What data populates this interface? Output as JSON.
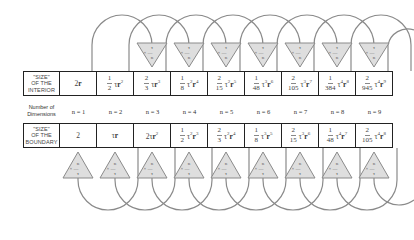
{
  "diagram": {
    "interior_row": {
      "header": "\"SIZE\" OF THE INTERIOR",
      "header_lines": [
        "\"SIZE\"",
        "OF THE",
        "INTERIOR"
      ],
      "cells": [
        {
          "coef_num": "",
          "coef_den": "",
          "expr": "2r",
          "tau_pow": "",
          "r_pow": ""
        },
        {
          "coef_num": "1",
          "coef_den": "2",
          "expr": "τr",
          "tau_pow": "",
          "r_pow": "2"
        },
        {
          "coef_num": "2",
          "coef_den": "3",
          "expr": "τr",
          "tau_pow": "",
          "r_pow": "3"
        },
        {
          "coef_num": "1",
          "coef_den": "8",
          "expr": "τr",
          "tau_pow": "2",
          "r_pow": "4"
        },
        {
          "coef_num": "2",
          "coef_den": "15",
          "expr": "τr",
          "tau_pow": "2",
          "r_pow": "5"
        },
        {
          "coef_num": "1",
          "coef_den": "48",
          "expr": "τr",
          "tau_pow": "3",
          "r_pow": "6"
        },
        {
          "coef_num": "2",
          "coef_den": "105",
          "expr": "τr",
          "tau_pow": "3",
          "r_pow": "7"
        },
        {
          "coef_num": "1",
          "coef_den": "384",
          "expr": "τr",
          "tau_pow": "4",
          "r_pow": "8"
        },
        {
          "coef_num": "2",
          "coef_den": "945",
          "expr": "τr",
          "tau_pow": "4",
          "r_pow": "9"
        }
      ]
    },
    "dimensions_row": {
      "label_lines": [
        "Number of",
        "Dimensions"
      ],
      "values": [
        "n = 1",
        "n = 2",
        "n = 3",
        "n = 4",
        "n = 5",
        "n = 6",
        "n = 7",
        "n = 8",
        "n = 9"
      ]
    },
    "boundary_row": {
      "header": "\"SIZE\" OF THE BOUNDARY",
      "header_lines": [
        "\"SIZE\"",
        "OF THE",
        "BOUNDARY"
      ],
      "cells": [
        {
          "coef_num": "",
          "coef_den": "",
          "expr": "2",
          "tau_pow": "",
          "r_pow": ""
        },
        {
          "coef_num": "",
          "coef_den": "",
          "expr": "τr",
          "tau_pow": "",
          "r_pow": ""
        },
        {
          "coef_num": "",
          "coef_den": "",
          "expr": "2τr",
          "tau_pow": "",
          "r_pow": "2"
        },
        {
          "coef_num": "1",
          "coef_den": "2",
          "expr": "τr",
          "tau_pow": "2",
          "r_pow": "3"
        },
        {
          "coef_num": "2",
          "coef_den": "3",
          "expr": "τr",
          "tau_pow": "2",
          "r_pow": "4"
        },
        {
          "coef_num": "1",
          "coef_den": "8",
          "expr": "τr",
          "tau_pow": "3",
          "r_pow": "5"
        },
        {
          "coef_num": "2",
          "coef_den": "15",
          "expr": "τr",
          "tau_pow": "3",
          "r_pow": "6"
        },
        {
          "coef_num": "1",
          "coef_den": "48",
          "expr": "τr",
          "tau_pow": "4",
          "r_pow": "7"
        },
        {
          "coef_num": "2",
          "coef_den": "105",
          "expr": "τr",
          "tau_pow": "4",
          "r_pow": "8"
        }
      ]
    },
    "top_operator": {
      "symbol": "×",
      "num": "τ",
      "den": "n"
    },
    "bottom_operator": {
      "symbol": "×",
      "num": "n",
      "den": "τ"
    },
    "colors": {
      "border": "#222222",
      "arc": "#888888",
      "triangle_fill": "#dddddd",
      "triangle_stroke": "#888888",
      "text": "#444444"
    }
  }
}
